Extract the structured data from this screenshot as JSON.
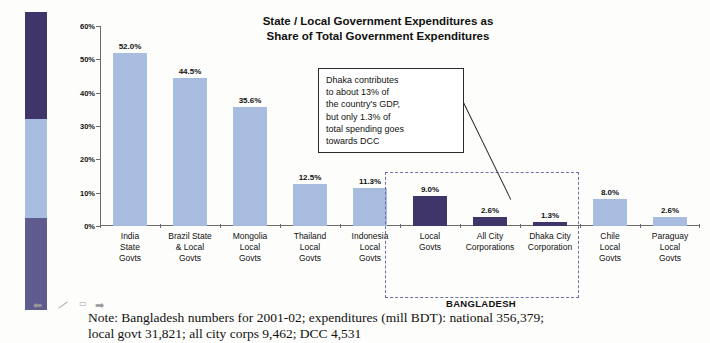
{
  "title_line1": "State / Local Government Expenditures as",
  "title_line2": "Share of  Total Government Expenditures",
  "callout": {
    "line1": "Dhaka contributes",
    "line2": "to about 13% of",
    "line3": "the country's GDP,",
    "line4": "but only 1.3% of",
    "line5": "total spending goes",
    "line6": "towards DCC"
  },
  "bangladesh_group_label": "BANGLADESH",
  "note_line1": "Note: Bangladesh numbers for 2001-02; expenditures (mill BDT): national 356,379;",
  "note_line2": "local govt 31,821; all city corps 9,462; DCC 4,531",
  "artifacts": {
    "arrow_left": "⬅",
    "dash": "—",
    "box": "▭",
    "arrow_right": "➡"
  },
  "colors": {
    "bar_light": "#a8bcdf",
    "bar_dark": "#3f3569",
    "strip_dark": "#3f3569",
    "strip_light": "#a8bcdf",
    "strip_mid": "#5f5b8e",
    "dashed_region": "#6f6fa8",
    "axis": "#6c6c6c"
  },
  "chart_data": {
    "type": "bar",
    "title": "State / Local Government Expenditures as Share of  Total Government Expenditures",
    "xlabel": "",
    "ylabel": "",
    "ylim": [
      0,
      60
    ],
    "ytick_labels": [
      "0%",
      "10%",
      "20%",
      "30%",
      "40%",
      "50%",
      "60%"
    ],
    "ytick_values": [
      0,
      10,
      20,
      30,
      40,
      50,
      60
    ],
    "grid": false,
    "legend": "none",
    "value_suffix": "%",
    "categories": [
      "India State Govts",
      "Brazil State & Local Govts",
      "Mongolia Local Govts",
      "Thailand Local Govts",
      "Indonesia Local Govts",
      "Local Govts",
      "All City Corporations",
      "Dhaka City Corporation",
      "Chile Local Govts",
      "Paraguay Local Govts"
    ],
    "values": [
      52.0,
      44.5,
      35.6,
      12.5,
      11.3,
      9.0,
      2.6,
      1.3,
      8.0,
      2.6
    ],
    "bars": [
      {
        "label_lines": [
          "India",
          "State",
          "Govts"
        ],
        "value": 52.0,
        "value_label": "52.0%",
        "color": "light"
      },
      {
        "label_lines": [
          "Brazil State",
          "& Local",
          "Govts"
        ],
        "value": 44.5,
        "value_label": "44.5%",
        "color": "light"
      },
      {
        "label_lines": [
          "Mongolia",
          "Local",
          "Govts"
        ],
        "value": 35.6,
        "value_label": "35.6%",
        "color": "light"
      },
      {
        "label_lines": [
          "Thailand",
          "Local",
          "Govts"
        ],
        "value": 12.5,
        "value_label": "12.5%",
        "color": "light"
      },
      {
        "label_lines": [
          "Indonesia",
          "Local",
          "Govts"
        ],
        "value": 11.3,
        "value_label": "11.3%",
        "color": "light"
      },
      {
        "label_lines": [
          "Local",
          "Govts"
        ],
        "value": 9.0,
        "value_label": "9.0%",
        "color": "dark"
      },
      {
        "label_lines": [
          "All City",
          "Corporations"
        ],
        "value": 2.6,
        "value_label": "2.6%",
        "color": "dark"
      },
      {
        "label_lines": [
          "Dhaka City",
          "Corporation"
        ],
        "value": 1.3,
        "value_label": "1.3%",
        "color": "dark"
      },
      {
        "label_lines": [
          "Chile",
          "Local",
          "Govts"
        ],
        "value": 8.0,
        "value_label": "8.0%",
        "color": "light"
      },
      {
        "label_lines": [
          "Paraguay",
          "Local",
          "Govts"
        ],
        "value": 2.6,
        "value_label": "2.6%",
        "color": "light"
      }
    ],
    "annotations": [
      {
        "text": "Dhaka contributes to about 13% of the country's GDP, but only 1.3% of total spending goes towards DCC",
        "points_to": "Dhaka City Corporation"
      },
      {
        "text": "BANGLADESH",
        "group": [
          "Local Govts",
          "All City Corporations",
          "Dhaka City Corporation"
        ]
      }
    ]
  }
}
